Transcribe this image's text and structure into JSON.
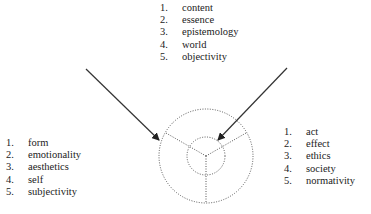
{
  "diagram": {
    "lists": {
      "top": [
        {
          "num": "1.",
          "label": "content"
        },
        {
          "num": "2.",
          "label": "essence"
        },
        {
          "num": "3.",
          "label": "epistemology"
        },
        {
          "num": "4.",
          "label": "world"
        },
        {
          "num": "5.",
          "label": "objectivity"
        }
      ],
      "left": [
        {
          "num": "1.",
          "label": "form"
        },
        {
          "num": "2.",
          "label": "emotionality"
        },
        {
          "num": "3.",
          "label": "aesthetics"
        },
        {
          "num": "4.",
          "label": "self"
        },
        {
          "num": "5.",
          "label": "subjectivity"
        }
      ],
      "right": [
        {
          "num": "1.",
          "label": "act"
        },
        {
          "num": "2.",
          "label": "effect"
        },
        {
          "num": "3.",
          "label": "ethics"
        },
        {
          "num": "4.",
          "label": "society"
        },
        {
          "num": "5.",
          "label": "normativity"
        }
      ]
    },
    "colors": {
      "line": "#333333",
      "dotted": "#555555"
    }
  }
}
